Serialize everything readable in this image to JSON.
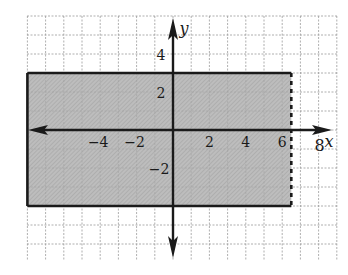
{
  "figure": {
    "type": "coordinate-plane-region",
    "axes": {
      "x_label": "x",
      "y_label": "y",
      "x_ticks": [
        {
          "value": -4,
          "label": "−4"
        },
        {
          "value": -2,
          "label": "−2"
        },
        {
          "value": 2,
          "label": "2"
        },
        {
          "value": 4,
          "label": "4"
        },
        {
          "value": 6,
          "label": "6"
        },
        {
          "value": 8,
          "label": "8"
        }
      ],
      "y_ticks": [
        {
          "value": 4,
          "label": "4"
        },
        {
          "value": 2,
          "label": "2"
        },
        {
          "value": -2,
          "label": "−2"
        }
      ]
    },
    "grid": {
      "x_min": -8,
      "x_max": 9,
      "y_min": -7,
      "y_max": 6,
      "step": 1
    },
    "region": {
      "x_min": -8,
      "x_max": 6.5,
      "y_min": -4,
      "y_max": 3,
      "left_boundary": "solid",
      "top_boundary": "solid",
      "bottom_boundary": "solid",
      "right_boundary": "dashed",
      "fill_color": "#b8b8b8"
    },
    "colors": {
      "axis": "#1a1a1a",
      "grid": "#9a9a9a",
      "boundary": "#1a1a1a"
    }
  }
}
